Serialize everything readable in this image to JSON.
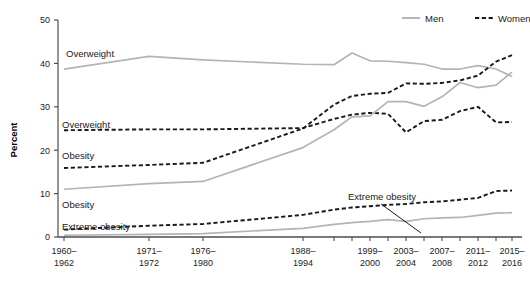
{
  "chart_data": {
    "type": "line",
    "title": "",
    "xlabel": "",
    "ylabel": "Percent",
    "ylim": [
      0,
      50
    ],
    "yticks": [
      0,
      10,
      20,
      30,
      40,
      50
    ],
    "ytick_labels": [
      "0",
      "10",
      "20",
      "30",
      "40",
      "50"
    ],
    "grid": false,
    "legend_position": "top-right",
    "legend": [
      {
        "name": "Men",
        "style": "solid",
        "color": "#b4b4b4"
      },
      {
        "name": "Women",
        "style": "dashed",
        "color": "#1a1a1a"
      }
    ],
    "categories": [
      "1960–\n1962",
      "1971–\n1972",
      "1976–\n1980",
      "1988–\n1994",
      "1999–\n2000",
      "2001–\n2002",
      "2003–\n2004",
      "2005–\n2006",
      "2007–\n2008",
      "2009–\n2010",
      "2011–\n2012",
      "2013–\n2014",
      "2015–\n2016"
    ],
    "xtick_labels": [
      {
        "label": "1960–",
        "label2": "1962",
        "x": 64
      },
      {
        "label": "1971–",
        "label2": "1972",
        "x": 149
      },
      {
        "label": "1976–",
        "label2": "1980",
        "x": 203
      },
      {
        "label": "1988–",
        "label2": "1994",
        "x": 303
      },
      {
        "label": "1999–",
        "label2": "2000",
        "x": 370
      },
      {
        "label": "2003–",
        "label2": "2004",
        "x": 406
      },
      {
        "label": "2007–",
        "label2": "2008",
        "x": 442
      },
      {
        "label": "2011–",
        "label2": "2012",
        "x": 478
      },
      {
        "label": "2015–",
        "label2": "2016",
        "x": 512
      }
    ],
    "series": [
      {
        "name": "Men Overweight",
        "sex": "Men",
        "measure": "Overweight",
        "style": "solid",
        "color": "#b4b4b4",
        "points": [
          {
            "x": 64,
            "v": 38.7
          },
          {
            "x": 149,
            "v": 41.6
          },
          {
            "x": 203,
            "v": 40.8
          },
          {
            "x": 303,
            "v": 39.8
          },
          {
            "x": 334,
            "v": 39.7
          },
          {
            "x": 352,
            "v": 42.4
          },
          {
            "x": 370,
            "v": 40.6
          },
          {
            "x": 388,
            "v": 40.5
          },
          {
            "x": 406,
            "v": 40.2
          },
          {
            "x": 424,
            "v": 39.8
          },
          {
            "x": 442,
            "v": 38.7
          },
          {
            "x": 460,
            "v": 38.7
          },
          {
            "x": 478,
            "v": 39.5
          },
          {
            "x": 496,
            "v": 38.7
          },
          {
            "x": 512,
            "v": 37.0
          }
        ]
      },
      {
        "name": "Women Overweight",
        "sex": "Women",
        "measure": "Overweight",
        "style": "dashed",
        "color": "#1a1a1a",
        "points": [
          {
            "x": 64,
            "v": 24.6
          },
          {
            "x": 149,
            "v": 24.8
          },
          {
            "x": 203,
            "v": 24.8
          },
          {
            "x": 303,
            "v": 25.1
          },
          {
            "x": 334,
            "v": 27.2
          },
          {
            "x": 352,
            "v": 28.2
          },
          {
            "x": 370,
            "v": 28.6
          },
          {
            "x": 388,
            "v": 28.4
          },
          {
            "x": 406,
            "v": 24.1
          },
          {
            "x": 424,
            "v": 26.7
          },
          {
            "x": 442,
            "v": 27.0
          },
          {
            "x": 460,
            "v": 29.0
          },
          {
            "x": 478,
            "v": 30.0
          },
          {
            "x": 496,
            "v": 26.4
          },
          {
            "x": 512,
            "v": 26.5
          }
        ]
      },
      {
        "name": "Women Obesity",
        "sex": "Women",
        "measure": "Obesity",
        "style": "dashed",
        "color": "#1a1a1a",
        "points": [
          {
            "x": 64,
            "v": 15.9
          },
          {
            "x": 149,
            "v": 16.6
          },
          {
            "x": 203,
            "v": 17.1
          },
          {
            "x": 303,
            "v": 25.0
          },
          {
            "x": 334,
            "v": 30.5
          },
          {
            "x": 352,
            "v": 32.5
          },
          {
            "x": 370,
            "v": 33.0
          },
          {
            "x": 388,
            "v": 33.2
          },
          {
            "x": 406,
            "v": 35.4
          },
          {
            "x": 424,
            "v": 35.3
          },
          {
            "x": 442,
            "v": 35.5
          },
          {
            "x": 460,
            "v": 36.1
          },
          {
            "x": 478,
            "v": 37.2
          },
          {
            "x": 496,
            "v": 40.4
          },
          {
            "x": 512,
            "v": 41.9
          }
        ]
      },
      {
        "name": "Men Obesity",
        "sex": "Men",
        "measure": "Obesity",
        "style": "solid",
        "color": "#b4b4b4",
        "points": [
          {
            "x": 64,
            "v": 11.0
          },
          {
            "x": 149,
            "v": 12.3
          },
          {
            "x": 203,
            "v": 12.8
          },
          {
            "x": 303,
            "v": 20.6
          },
          {
            "x": 334,
            "v": 24.7
          },
          {
            "x": 352,
            "v": 27.7
          },
          {
            "x": 370,
            "v": 27.9
          },
          {
            "x": 388,
            "v": 31.2
          },
          {
            "x": 406,
            "v": 31.2
          },
          {
            "x": 424,
            "v": 30.1
          },
          {
            "x": 442,
            "v": 32.3
          },
          {
            "x": 460,
            "v": 35.6
          },
          {
            "x": 478,
            "v": 34.4
          },
          {
            "x": 496,
            "v": 35.0
          },
          {
            "x": 512,
            "v": 38.0
          }
        ]
      },
      {
        "name": "Women Extreme obesity",
        "sex": "Women",
        "measure": "Extreme obesity",
        "style": "dashed",
        "color": "#1a1a1a",
        "points": [
          {
            "x": 64,
            "v": 1.7
          },
          {
            "x": 149,
            "v": 2.6
          },
          {
            "x": 203,
            "v": 3.0
          },
          {
            "x": 303,
            "v": 5.1
          },
          {
            "x": 334,
            "v": 6.3
          },
          {
            "x": 352,
            "v": 6.8
          },
          {
            "x": 370,
            "v": 7.1
          },
          {
            "x": 388,
            "v": 7.4
          },
          {
            "x": 406,
            "v": 7.6
          },
          {
            "x": 424,
            "v": 8.0
          },
          {
            "x": 442,
            "v": 8.2
          },
          {
            "x": 460,
            "v": 8.6
          },
          {
            "x": 478,
            "v": 9.0
          },
          {
            "x": 496,
            "v": 10.6
          },
          {
            "x": 512,
            "v": 10.7
          }
        ]
      },
      {
        "name": "Men Extreme obesity",
        "sex": "Men",
        "measure": "Extreme obesity",
        "style": "solid",
        "color": "#b4b4b4",
        "points": [
          {
            "x": 64,
            "v": 0.4
          },
          {
            "x": 149,
            "v": 0.6
          },
          {
            "x": 203,
            "v": 0.8
          },
          {
            "x": 303,
            "v": 2.0
          },
          {
            "x": 334,
            "v": 2.9
          },
          {
            "x": 352,
            "v": 3.3
          },
          {
            "x": 370,
            "v": 3.6
          },
          {
            "x": 388,
            "v": 4.0
          },
          {
            "x": 406,
            "v": 3.6
          },
          {
            "x": 424,
            "v": 4.2
          },
          {
            "x": 442,
            "v": 4.4
          },
          {
            "x": 460,
            "v": 4.5
          },
          {
            "x": 478,
            "v": 5.0
          },
          {
            "x": 496,
            "v": 5.5
          },
          {
            "x": 512,
            "v": 5.6
          }
        ]
      }
    ],
    "annotations": [
      {
        "id": "men-overweight-label",
        "text": "Overweight",
        "x": 66,
        "y": 57
      },
      {
        "id": "women-overweight-label",
        "text": "Overweight",
        "x": 62,
        "y": 128
      },
      {
        "id": "women-obesity-label",
        "text": "Obesity",
        "x": 62,
        "y": 159
      },
      {
        "id": "men-obesity-label",
        "text": "Obesity",
        "x": 62,
        "y": 208
      },
      {
        "id": "women-extreme-label",
        "text": "Extreme obesity",
        "x": 62,
        "y": 230
      },
      {
        "id": "men-extreme-label",
        "text": "Extreme obesity",
        "x": 348,
        "y": 200
      }
    ],
    "leader_line": {
      "x1": 381,
      "y1": 204,
      "x2": 421,
      "y2": 233
    }
  },
  "axes": {
    "x_tick_positions": [
      64,
      149,
      203,
      303,
      334,
      352,
      370,
      388,
      406,
      424,
      442,
      460,
      478,
      496,
      512
    ],
    "plot_left": 58,
    "plot_right": 522,
    "plot_top": 20,
    "plot_bottom": 237
  }
}
